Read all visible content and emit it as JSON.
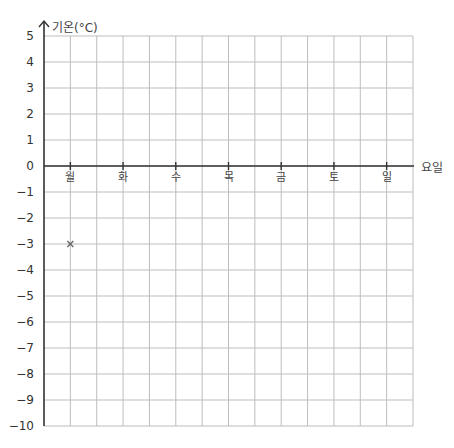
{
  "chart_data": {
    "type": "line",
    "title": "",
    "xlabel": "요일",
    "ylabel": "기온(°C)",
    "categories": [
      "월",
      "화",
      "수",
      "목",
      "금",
      "토",
      "일"
    ],
    "series": [
      {
        "name": "기온",
        "marker": "x",
        "values": [
          -3,
          null,
          null,
          null,
          null,
          null,
          null
        ]
      }
    ],
    "ylim": [
      -10,
      5
    ],
    "yticks": [
      5,
      4,
      3,
      2,
      1,
      0,
      -1,
      -2,
      -3,
      -4,
      -5,
      -6,
      -7,
      -8,
      -9,
      -10
    ],
    "grid": true,
    "legend": "none"
  },
  "labels": {
    "y_axis_title": "기온(°C)",
    "x_axis_title": "요일",
    "yticks": [
      "5",
      "4",
      "3",
      "2",
      "1",
      "0",
      "−1",
      "−2",
      "−3",
      "−4",
      "−5",
      "−6",
      "−7",
      "−8",
      "−9",
      "−10"
    ],
    "days": [
      "월",
      "화",
      "수",
      "목",
      "금",
      "토",
      "일"
    ]
  },
  "colors": {
    "grid": "#bdbdbd",
    "axis": "#333333",
    "marker": "#666666"
  }
}
